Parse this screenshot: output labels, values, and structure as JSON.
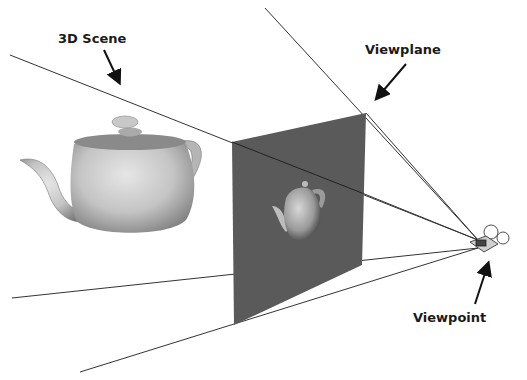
{
  "diagram": {
    "labels": {
      "scene": "3D Scene",
      "viewplane": "Viewplane",
      "viewpoint": "Viewpoint"
    },
    "colors": {
      "background": "#ffffff",
      "plane": "#5a5a5a",
      "lines": "#333333",
      "text": "#1a1a1a"
    }
  }
}
